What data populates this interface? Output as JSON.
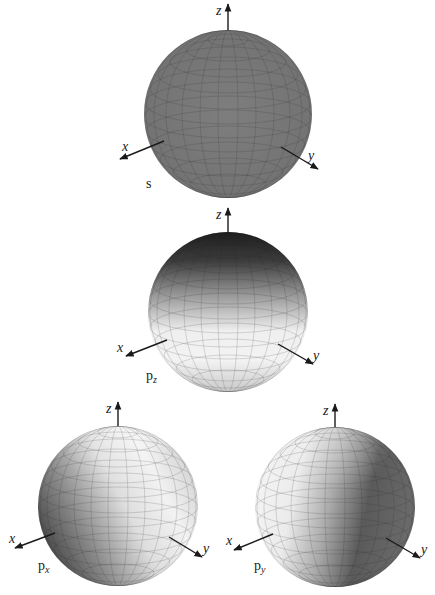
{
  "figure": {
    "title": "",
    "axis_labels": {
      "x": "x",
      "y": "y",
      "z": "z"
    },
    "orbitals": [
      {
        "id": "s",
        "label": "p",
        "label_main": "s",
        "label_sub": "",
        "shading": "uniform",
        "color": "#7b7b7b"
      },
      {
        "id": "pz",
        "label_main": "p",
        "label_sub": "z",
        "shading": "dark-top",
        "color_dark": "#262626",
        "color_light": "#f4f4f4"
      },
      {
        "id": "px",
        "label_main": "p",
        "label_sub": "x",
        "shading": "dark-toward-x",
        "color_dark": "#5a5a5a",
        "color_light": "#f2f2f2"
      },
      {
        "id": "py",
        "label_main": "p",
        "label_sub": "y",
        "shading": "dark-toward-y",
        "color_dark": "#4a4a4a",
        "color_light": "#f2f2f2"
      }
    ]
  }
}
